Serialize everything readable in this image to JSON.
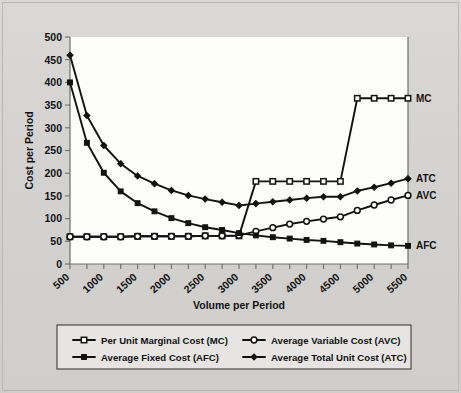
{
  "chart_data": {
    "type": "line",
    "title": "",
    "xlabel": "Volume per Period",
    "ylabel": "Cost per Period",
    "xlim": [
      500,
      5500
    ],
    "ylim": [
      0,
      500
    ],
    "grid": false,
    "legend_position": "bottom",
    "x": [
      500,
      750,
      1000,
      1250,
      1500,
      1750,
      2000,
      2250,
      2500,
      2750,
      3000,
      3250,
      3500,
      3750,
      4000,
      4250,
      4500,
      4750,
      5000,
      5250,
      5500
    ],
    "x_tick_labels": [
      "500",
      "1000",
      "1500",
      "2000",
      "2500",
      "3000",
      "3500",
      "4000",
      "4500",
      "5000",
      "5500"
    ],
    "x_tick_values": [
      500,
      1000,
      1500,
      2000,
      2500,
      3000,
      3500,
      4000,
      4500,
      5000,
      5500
    ],
    "y_tick_labels": [
      "0",
      "50",
      "100",
      "150",
      "200",
      "250",
      "300",
      "350",
      "400",
      "450",
      "500"
    ],
    "y_tick_values": [
      0,
      50,
      100,
      150,
      200,
      250,
      300,
      350,
      400,
      450,
      500
    ],
    "series": [
      {
        "name": "Per Unit Marginal Cost (MC)",
        "short": "MC",
        "marker": "open-square",
        "values": [
          60,
          60,
          60,
          60,
          61,
          61,
          61,
          61,
          62,
          62,
          62,
          182,
          182,
          182,
          182,
          182,
          182,
          365,
          365,
          365,
          365
        ]
      },
      {
        "name": "Average Variable Cost (AVC)",
        "short": "AVC",
        "marker": "open-circle",
        "values": [
          60,
          60,
          60,
          60,
          61,
          61,
          61,
          61,
          62,
          62,
          63,
          72,
          80,
          88,
          94,
          99,
          104,
          118,
          130,
          141,
          151
        ]
      },
      {
        "name": "Average Fixed Cost (AFC)",
        "short": "AFC",
        "marker": "filled-square",
        "values": [
          400,
          267,
          201,
          160,
          134,
          116,
          101,
          90,
          81,
          75,
          68,
          63,
          59,
          56,
          53,
          51,
          48,
          45,
          43,
          41,
          40
        ]
      },
      {
        "name": "Average Total Unit Cost (ATC)",
        "short": "ATC",
        "marker": "filled-diamond",
        "values": [
          460,
          327,
          261,
          221,
          194,
          177,
          162,
          151,
          143,
          136,
          129,
          133,
          137,
          141,
          145,
          148,
          148,
          161,
          169,
          178,
          188
        ]
      }
    ]
  },
  "series_end_labels": [
    {
      "short": "MC",
      "value": 365
    },
    {
      "short": "ATC",
      "value": 188
    },
    {
      "short": "AVC",
      "value": 151
    },
    {
      "short": "AFC",
      "value": 40
    }
  ],
  "legend": {
    "entries": [
      {
        "label": "Per Unit Marginal Cost (MC)",
        "marker": "open-square"
      },
      {
        "label": "Average Variable Cost (AVC)",
        "marker": "open-circle"
      },
      {
        "label": "Average Fixed Cost (AFC)",
        "marker": "filled-square"
      },
      {
        "label": "Average Total Unit Cost (ATC)",
        "marker": "filled-diamond"
      }
    ]
  },
  "colors": {
    "ink": "#121212",
    "axis": "#6e6e6e",
    "plot_background": "#fdfdfc",
    "page_background": "#d4d3d1",
    "legend_background": "#e6e5e3"
  }
}
